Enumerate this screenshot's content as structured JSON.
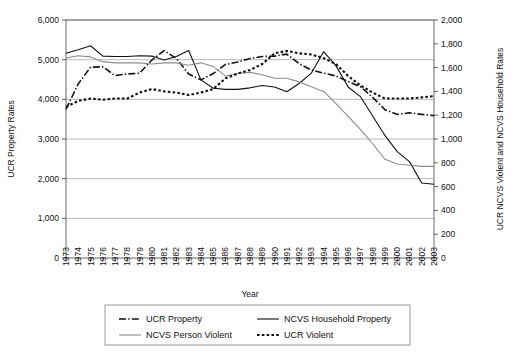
{
  "chart_data": {
    "type": "line",
    "title": "",
    "xlabel": "Year",
    "ylabel": "UCR Property Rates",
    "y2label": "UCR NCVS Violent and NCVS Household Rates",
    "grid": true,
    "legend_position": "bottom",
    "ylim": [
      0,
      6000
    ],
    "y2lim": [
      0,
      2000
    ],
    "yticks": [
      "0",
      "1,000",
      "2,000",
      "3,000",
      "4,000",
      "5,000",
      "6,000"
    ],
    "ytick_values": [
      0,
      1000,
      2000,
      3000,
      4000,
      5000,
      6000
    ],
    "y2ticks": [
      "0",
      "200",
      "400",
      "600",
      "800",
      "1,000",
      "1,200",
      "1,400",
      "1,600",
      "1,800",
      "2,000"
    ],
    "y2tick_values": [
      0,
      200,
      400,
      600,
      800,
      1000,
      1200,
      1400,
      1600,
      1800,
      2000
    ],
    "categories": [
      "1973",
      "1974",
      "1975",
      "1976",
      "1977",
      "1978",
      "1979",
      "1980",
      "1981",
      "1982",
      "1983",
      "1984",
      "1985",
      "1986",
      "1987",
      "1988",
      "1989",
      "1990",
      "1991",
      "1992",
      "1993",
      "1994",
      "1995",
      "1996",
      "1997",
      "1998",
      "1999",
      "2000",
      "2001",
      "2002",
      "2003"
    ],
    "x": [
      1973,
      1974,
      1975,
      1976,
      1977,
      1978,
      1979,
      1980,
      1981,
      1982,
      1983,
      1984,
      1985,
      1986,
      1987,
      1988,
      1989,
      1990,
      1991,
      1992,
      1993,
      1994,
      1995,
      1996,
      1997,
      1998,
      1999,
      2000,
      2001,
      2002,
      2003
    ],
    "series": [
      {
        "name": "UCR Property",
        "axis": "left",
        "style": "dash-dot",
        "color": "#111111",
        "width": 1.6,
        "values": [
          3750,
          4390,
          4810,
          4820,
          4600,
          4640,
          4660,
          4990,
          5230,
          5030,
          4640,
          4490,
          4650,
          4880,
          4940,
          5030,
          5080,
          5090,
          5140,
          4900,
          4740,
          4660,
          4590,
          4450,
          4320,
          4050,
          3740,
          3620,
          3660,
          3620,
          3590
        ]
      },
      {
        "name": "NCVS Household Property",
        "axis": "left",
        "style": "solid-thin",
        "color": "#111111",
        "width": 1.1,
        "values": [
          5160,
          5250,
          5350,
          5090,
          5080,
          5080,
          5100,
          5090,
          4990,
          5080,
          5230,
          4490,
          4280,
          4250,
          4250,
          4290,
          4350,
          4310,
          4190,
          4400,
          4660,
          5200,
          4850,
          4310,
          4070,
          3580,
          3090,
          2680,
          2430,
          1890,
          1860
        ]
      },
      {
        "name": "NCVS Person Violent",
        "axis": "right",
        "style": "solid-gray",
        "color": "#8c8c8c",
        "width": 1.1,
        "values": [
          1680,
          1700,
          1690,
          1650,
          1640,
          1640,
          1640,
          1630,
          1640,
          1640,
          1620,
          1640,
          1610,
          1530,
          1550,
          1560,
          1540,
          1510,
          1510,
          1480,
          1440,
          1400,
          1300,
          1190,
          1080,
          960,
          830,
          790,
          780,
          770,
          770
        ]
      },
      {
        "name": "UCR Violent",
        "axis": "right",
        "style": "dotted",
        "color": "#111111",
        "width": 2.1,
        "values": [
          1270,
          1320,
          1340,
          1330,
          1340,
          1340,
          1390,
          1420,
          1400,
          1390,
          1370,
          1390,
          1420,
          1510,
          1550,
          1580,
          1630,
          1720,
          1740,
          1720,
          1710,
          1680,
          1630,
          1530,
          1450,
          1390,
          1340,
          1340,
          1340,
          1350,
          1360
        ]
      }
    ]
  },
  "legend": {
    "items": [
      {
        "label": "UCR Property",
        "style": "dash-dot"
      },
      {
        "label": "NCVS Household Property",
        "style": "solid-gray"
      },
      {
        "label": "NCVS Person Violent",
        "style": "solid-thin"
      },
      {
        "label": "UCR Violent",
        "style": "dotted"
      }
    ]
  }
}
